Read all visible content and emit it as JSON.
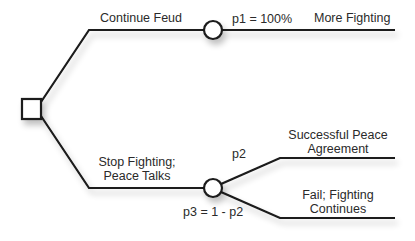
{
  "diagram": {
    "type": "decision-tree",
    "decision_node": {
      "shape": "square"
    },
    "branches": [
      {
        "label": "Continue Feud",
        "chance_node": {
          "shape": "circle"
        },
        "outcomes": [
          {
            "probability": "p1 = 100%",
            "label": "More Fighting"
          }
        ]
      },
      {
        "label_line1": "Stop Fighting;",
        "label_line2": "Peace Talks",
        "chance_node": {
          "shape": "circle"
        },
        "outcomes": [
          {
            "probability": "p2",
            "label_line1": "Successful Peace",
            "label_line2": "Agreement"
          },
          {
            "probability": "p3 = 1 - p2",
            "label_line1": "Fail; Fighting",
            "label_line2": "Continues"
          }
        ]
      }
    ],
    "colors": {
      "line": "#1a1a1a",
      "text": "#2a2a2a",
      "shadow": "#cfcfcf"
    }
  }
}
